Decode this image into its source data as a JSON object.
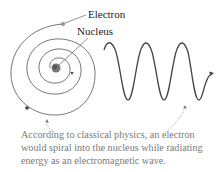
{
  "diagram": {
    "labels": {
      "electron": "Electron",
      "nucleus": "Nucleus"
    },
    "caption_lines": [
      "According to classical physics, an electron",
      "would spiral into the nucleus while radiating",
      "energy as an electromagnetic wave."
    ],
    "colors": {
      "line": "#555555",
      "text": "#222222",
      "caption": "#7a7a7a",
      "dotted": "#888888"
    },
    "elements": [
      {
        "id": "spiral-orbit",
        "type": "spiral",
        "center": [
          56,
          68
        ]
      },
      {
        "id": "nucleus",
        "type": "shaded-circle",
        "center": [
          56,
          68
        ]
      },
      {
        "id": "electron",
        "type": "point",
        "position": [
          63,
          24
        ]
      },
      {
        "id": "em-wave",
        "type": "sine-wave",
        "cycles": 3,
        "x_range": [
          104,
          200
        ]
      },
      {
        "id": "pointer-spiral",
        "type": "dotted-arrow",
        "target": "spiral-orbit"
      },
      {
        "id": "pointer-wave",
        "type": "dotted-arrow",
        "target": "em-wave"
      }
    ]
  }
}
